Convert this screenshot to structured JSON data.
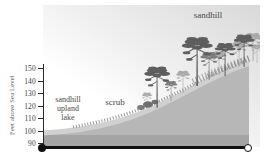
{
  "diagram": {
    "type": "ecological-elevation-cross-section",
    "y_axis": {
      "title": "Feet above Sea Level",
      "ticks": [
        "150",
        "140",
        "130",
        "120",
        "110",
        "100",
        "90"
      ]
    },
    "zones": {
      "sandhill": "sandhill",
      "scrub": "scrub",
      "lake_lines": [
        "sandhill",
        "upland",
        "lake"
      ]
    },
    "colors": {
      "hill_body": "#b7b7b7",
      "hill_surface_light": "#d0d0d0",
      "hill_bottom_band": "#a4a4a4",
      "tree_dark": "#5e5e5e",
      "tree_mid": "#7d7d7d",
      "tree_light": "#a9a9a9",
      "axis": "#2a2a2a",
      "baseline": "#101010"
    }
  }
}
